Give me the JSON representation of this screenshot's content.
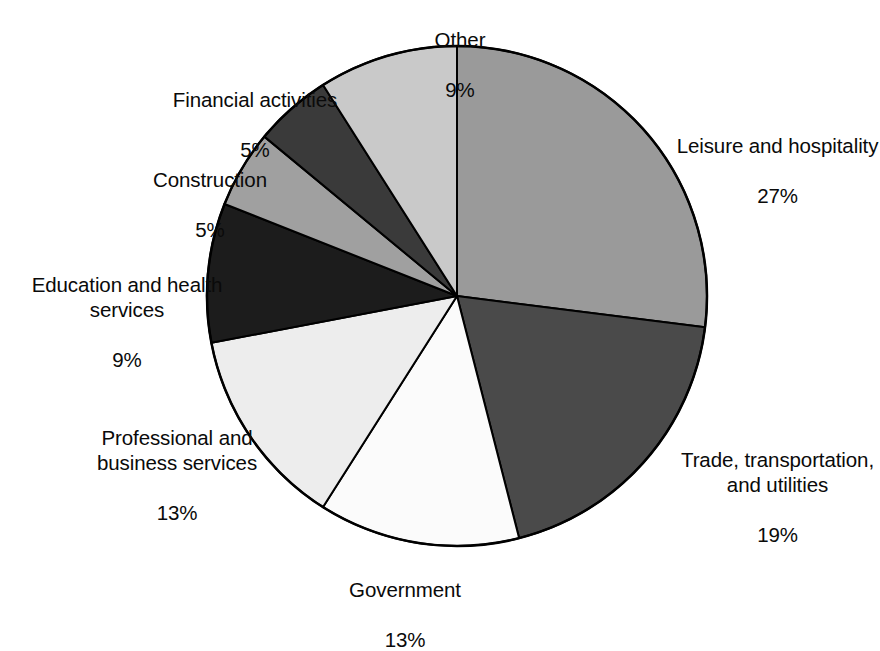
{
  "chart_data": {
    "type": "pie",
    "title": "",
    "subtitle": "",
    "xlabel": "",
    "ylabel": "",
    "legend_position": "none",
    "grid": false,
    "labels_outside": true,
    "start_angle_deg": 0,
    "direction": "clockwise",
    "units": "percent",
    "categories": [
      "Leisure and hospitality",
      "Trade, transportation, and utilities",
      "Government",
      "Professional and business services",
      "Education and health services",
      "Construction",
      "Financial activities",
      "Other"
    ],
    "values": [
      27,
      19,
      13,
      13,
      9,
      5,
      5,
      9
    ],
    "slices": [
      {
        "id": "leisure",
        "name": "Leisure and hospitality",
        "name_lines": [
          "Leisure and hospitality"
        ],
        "value": 27,
        "value_label": "27%",
        "color": "#9a9a9a",
        "start_deg": 0,
        "end_deg": 97.2
      },
      {
        "id": "trade",
        "name": "Trade, transportation, and utilities",
        "name_lines": [
          "Trade, transportation,",
          "and utilities"
        ],
        "value": 19,
        "value_label": "19%",
        "color": "#4a4a4a",
        "start_deg": 97.2,
        "end_deg": 165.6
      },
      {
        "id": "government",
        "name": "Government",
        "name_lines": [
          "Government"
        ],
        "value": 13,
        "value_label": "13%",
        "color": "#fbfbfb",
        "start_deg": 165.6,
        "end_deg": 212.4
      },
      {
        "id": "professional",
        "name": "Professional and business services",
        "name_lines": [
          "Professional and",
          "business services"
        ],
        "value": 13,
        "value_label": "13%",
        "color": "#ededed",
        "start_deg": 212.4,
        "end_deg": 259.2
      },
      {
        "id": "education",
        "name": "Education and health services",
        "name_lines": [
          "Education and health",
          "services"
        ],
        "value": 9,
        "value_label": "9%",
        "color": "#1c1c1c",
        "start_deg": 259.2,
        "end_deg": 291.6
      },
      {
        "id": "construction",
        "name": "Construction",
        "name_lines": [
          "Construction"
        ],
        "value": 5,
        "value_label": "5%",
        "color": "#a0a0a0",
        "start_deg": 291.6,
        "end_deg": 309.6
      },
      {
        "id": "financial",
        "name": "Financial activities",
        "name_lines": [
          "Financial activities"
        ],
        "value": 5,
        "value_label": "5%",
        "color": "#3a3a3a",
        "start_deg": 309.6,
        "end_deg": 327.6
      },
      {
        "id": "other",
        "name": "Other",
        "name_lines": [
          "Other"
        ],
        "value": 9,
        "value_label": "9%",
        "color": "#c9c9c9",
        "start_deg": 327.6,
        "end_deg": 360
      }
    ],
    "geometry": {
      "center_x": 457,
      "center_y": 296,
      "radius": 250,
      "outline_color": "#000000",
      "outline_width": 2,
      "background": "#ffffff"
    }
  },
  "labels": {
    "other": {
      "name": "Other",
      "value": "9%"
    },
    "financial": {
      "name": "Financial activities",
      "value": "5%"
    },
    "construction": {
      "name": "Construction",
      "value": "5%"
    },
    "education": {
      "name": "Education and health\nservices",
      "value": "9%"
    },
    "professional": {
      "name": "Professional and\nbusiness services",
      "value": "13%"
    },
    "government": {
      "name": "Government",
      "value": "13%"
    },
    "trade": {
      "name": "Trade, transportation,\nand utilities",
      "value": "19%"
    },
    "leisure": {
      "name": "Leisure and hospitality",
      "value": "27%"
    }
  }
}
